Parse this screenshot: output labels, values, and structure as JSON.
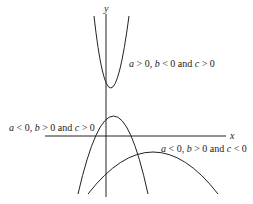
{
  "axes": {
    "x_label": "x",
    "y_label": "y"
  },
  "curves": [
    {
      "id": "upward-parabola",
      "label": {
        "a": "a",
        "op1": " > 0, ",
        "b": "b",
        "op2": " < 0 and ",
        "c": "c",
        "op3": " > 0"
      }
    },
    {
      "id": "downward-parabola-positive-c",
      "label": {
        "a": "a",
        "op1": " < 0, ",
        "b": "b",
        "op2": " > 0 and ",
        "c": "c",
        "op3": " > 0"
      }
    },
    {
      "id": "downward-parabola-negative-c",
      "label": {
        "a": "a",
        "op1": " < 0, ",
        "b": "b",
        "op2": " > 0 and ",
        "c": "c",
        "op3": " < 0"
      }
    }
  ]
}
